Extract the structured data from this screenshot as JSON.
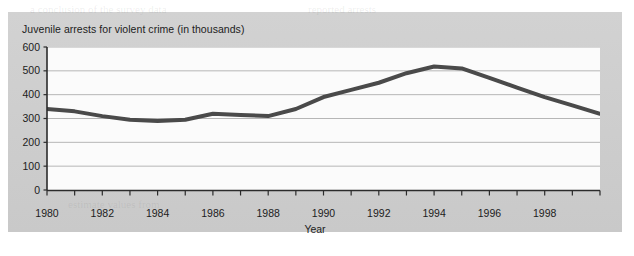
{
  "chart_data": {
    "type": "line",
    "title": "Juvenile arrests for violent crime (in thousands)",
    "xlabel": "Year",
    "ylabel": "",
    "xlim": [
      1980,
      2000
    ],
    "ylim": [
      0,
      600
    ],
    "grid": true,
    "legend": "none",
    "y_ticks": [
      600,
      500,
      400,
      300,
      200,
      100,
      0
    ],
    "y_tick_labels": [
      "600",
      "500",
      "400",
      "300",
      "200",
      "100",
      "0"
    ],
    "x_ticks": [
      1980,
      1981,
      1982,
      1983,
      1984,
      1985,
      1986,
      1987,
      1988,
      1989,
      1990,
      1991,
      1992,
      1993,
      1994,
      1995,
      1996,
      1997,
      1998,
      1999,
      2000
    ],
    "x_tick_labels": [
      "1980",
      "",
      "1982",
      "",
      "1984",
      "",
      "1986",
      "",
      "1988",
      "",
      "1990",
      "",
      "1992",
      "",
      "1994",
      "",
      "1996",
      "",
      "1998",
      "",
      ""
    ],
    "x": [
      1980,
      1981,
      1982,
      1983,
      1984,
      1985,
      1986,
      1987,
      1988,
      1989,
      1990,
      1991,
      1992,
      1993,
      1994,
      1995,
      1996,
      1997,
      1998,
      1999,
      2000
    ],
    "values": [
      340,
      330,
      310,
      295,
      290,
      295,
      320,
      315,
      310,
      340,
      390,
      420,
      450,
      490,
      518,
      510,
      470,
      430,
      390,
      355,
      320
    ],
    "series": [
      {
        "name": "Juvenile arrests for violent crime",
        "color": "#4a4a4a",
        "line_width": 4,
        "values": [
          340,
          330,
          310,
          295,
          290,
          295,
          320,
          315,
          310,
          340,
          390,
          420,
          450,
          490,
          518,
          510,
          470,
          430,
          390,
          355,
          320
        ]
      }
    ]
  },
  "figure": {
    "panel_color": "#cfcfcf",
    "plot_background": "#fbfbfb",
    "gridline_color": "#b6b6b6",
    "axis_color": "#2b2b2b",
    "text_color": "#1c1c1c"
  }
}
